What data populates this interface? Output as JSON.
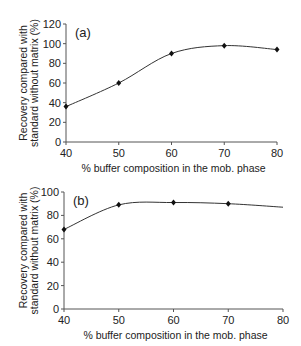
{
  "chart_data": [
    {
      "type": "line",
      "panel_label": "(a)",
      "xlabel": "% buffer composition in the mob. phase",
      "ylabel_line1": "Recovery compared with",
      "ylabel_line2": "standard without matrix (%)",
      "x": [
        40,
        50,
        60,
        70,
        80
      ],
      "values": [
        36,
        60,
        90,
        98,
        94
      ],
      "xticks": [
        "40",
        "50",
        "60",
        "70",
        "80"
      ],
      "yticks": [
        "0",
        "20",
        "40",
        "60",
        "80",
        "100",
        "120"
      ],
      "xlim": [
        40,
        80
      ],
      "ylim": [
        0,
        120
      ],
      "grid": false,
      "markers": "diamond"
    },
    {
      "type": "line",
      "panel_label": "(b)",
      "xlabel": "% buffer composition in the mob. phase",
      "ylabel_line1": "Recovery compared with",
      "ylabel_line2": "standard without matrix (%)",
      "x": [
        40,
        50,
        60,
        70,
        80
      ],
      "values": [
        68,
        89,
        91,
        90,
        87
      ],
      "marker_points": [
        0,
        1,
        2,
        3
      ],
      "xticks": [
        "40",
        "50",
        "60",
        "70",
        "80"
      ],
      "yticks": [
        "0",
        "20",
        "40",
        "60",
        "80",
        "100"
      ],
      "xlim": [
        40,
        80
      ],
      "ylim": [
        0,
        100
      ],
      "grid": false,
      "markers": "diamond"
    }
  ]
}
